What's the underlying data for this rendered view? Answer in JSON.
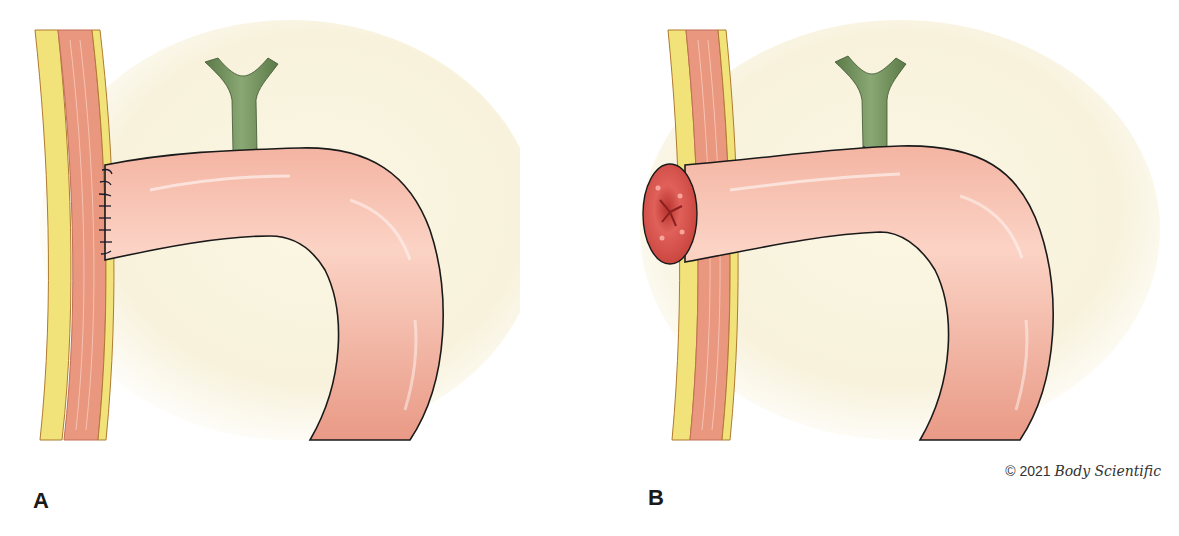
{
  "figure": {
    "panels": [
      {
        "label": "A",
        "description": "Sutured end of intestinal limb against abdominal wall with vascular pedicle"
      },
      {
        "label": "B",
        "description": "Intestinal limb brought through abdominal wall forming stoma with vascular pedicle"
      }
    ],
    "copyright": {
      "symbol_year": "© 2021",
      "brand": "Body Scientific"
    },
    "colors": {
      "background": "#fbf8ea",
      "bowel": "#f2ab98",
      "bowel_highlight": "#fbd6ca",
      "outline": "#1a1a1a",
      "stoma": "#d8524a",
      "vessel": "#6f8f5a",
      "fat": "#f1e27a",
      "muscle": "#e9977f"
    }
  }
}
